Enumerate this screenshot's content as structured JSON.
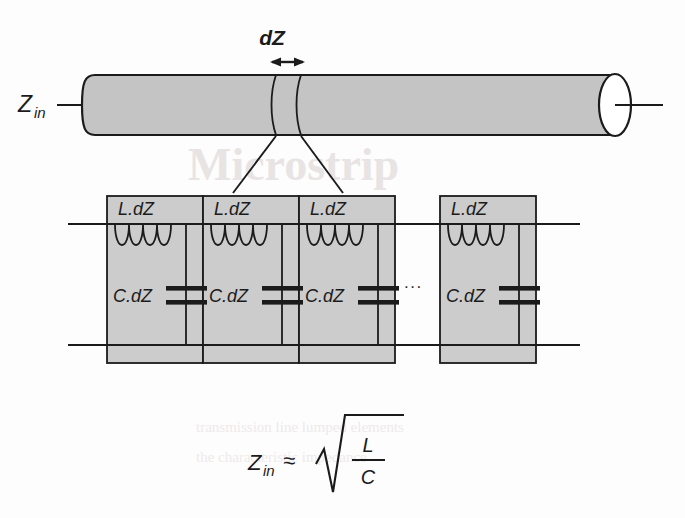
{
  "figure": {
    "type": "transmission-line-lumped-element-model",
    "title_watermark": "Microstrip",
    "watermark_line_bottom_1": "transmission line lumped elements",
    "watermark_line_bottom_2": "the characteristic impedance"
  },
  "cylinder": {
    "input_label": "Z",
    "input_label_sub": "in",
    "slice_label": "dZ",
    "fill_color": "#c4c4c4",
    "stroke_color": "#1b1b1b",
    "end_cap_color": "#ffffff"
  },
  "circuit": {
    "cells": [
      {
        "inductor_label": "L.dZ",
        "capacitor_label": "C.dZ"
      },
      {
        "inductor_label": "L.dZ",
        "capacitor_label": "C.dZ"
      },
      {
        "inductor_label": "L.dZ",
        "capacitor_label": "C.dZ"
      },
      {
        "inductor_label": "L.dZ",
        "capacitor_label": "C.dZ"
      }
    ],
    "continuation_marker": "...",
    "cell_fill_color": "#cccccc",
    "wire_color": "#1b1b1b"
  },
  "equation": {
    "lhs": "Z",
    "lhs_sub": "in",
    "operator": "≈",
    "radical": "√",
    "numerator": "L",
    "denominator": "C"
  }
}
